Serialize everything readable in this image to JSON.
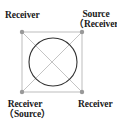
{
  "diagram": {
    "type": "transducer-layout",
    "colors": {
      "square": "#bdbdbd",
      "diagonals": "#c4c4c4",
      "circle": "#333333",
      "nodes": "#999999",
      "text": "#1a1a1a",
      "background": "#ffffff"
    },
    "nodes": [
      {
        "id": "top-left",
        "x": 22,
        "y": 32,
        "label_lines": [
          "Receiver"
        ]
      },
      {
        "id": "top-right",
        "x": 82,
        "y": 32,
        "label_lines": [
          "Source",
          "（Receiver）"
        ]
      },
      {
        "id": "bottom-left",
        "x": 22,
        "y": 92,
        "label_lines": [
          "Receiver",
          "（Source）"
        ]
      },
      {
        "id": "bottom-right",
        "x": 82,
        "y": 92,
        "label_lines": [
          "Receiver"
        ]
      }
    ],
    "square": {
      "x": 22,
      "y": 32,
      "width": 60,
      "height": 60
    },
    "circle": {
      "cx": 53,
      "cy": 62,
      "r": 24
    },
    "diagonals": [
      {
        "from": "top-left",
        "to": "bottom-right"
      },
      {
        "from": "top-right",
        "to": "bottom-left"
      }
    ]
  },
  "labels": {
    "top_left": {
      "line1": "Receiver"
    },
    "top_right": {
      "line1": "Source",
      "line2": "（Receiver）"
    },
    "bottom_left": {
      "line1": "Receiver",
      "line2": "（Source）"
    },
    "bottom_right": {
      "line1": "Receiver"
    }
  }
}
